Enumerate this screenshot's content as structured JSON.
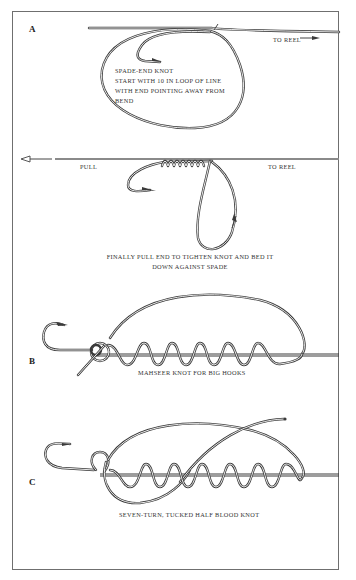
{
  "figure": {
    "panels": [
      {
        "id": "A",
        "letter": "A",
        "step1": {
          "to_reel": "TO REEL",
          "caption_lines": [
            "SPADE-END KNOT",
            "START WITH 10 IN LOOP OF LINE",
            "WITH END POINTING AWAY FROM",
            "BEND"
          ]
        },
        "step2": {
          "pull": "PULL",
          "to_reel": "TO REEL",
          "caption_lines": [
            "FINALLY PULL END TO TIGHTEN KNOT AND BED IT",
            "DOWN AGAINST SPADE"
          ]
        }
      },
      {
        "id": "B",
        "letter": "B",
        "caption": "MAHSEER KNOT FOR BIG HOOKS",
        "turns": 6
      },
      {
        "id": "C",
        "letter": "C",
        "caption": "SEVEN-TURN, TUCKED HALF BLOOD KNOT",
        "turns": 7
      }
    ],
    "icons": [
      "arrow-right-icon",
      "arrow-left-icon",
      "hook-icon"
    ],
    "colors": {
      "line": "#3a3a3a",
      "frame": "#6f6f6f",
      "background": "#ffffff"
    }
  }
}
